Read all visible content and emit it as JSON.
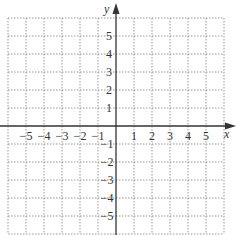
{
  "chart_data": {
    "type": "scatter",
    "title": "",
    "xlabel": "x",
    "ylabel": "y",
    "xlim": [
      -6,
      6
    ],
    "ylim": [
      -6,
      6
    ],
    "grid": true,
    "grid_style": "dotted",
    "x_ticks": [
      "-5",
      "-4",
      "-3",
      "-2",
      "-1",
      "1",
      "2",
      "3",
      "4",
      "5"
    ],
    "y_ticks": [
      "5",
      "4",
      "3",
      "2",
      "1",
      "-1",
      "-2",
      "-3",
      "-4",
      "-5"
    ],
    "series": []
  },
  "labels": {
    "x_axis": "x",
    "y_axis": "y",
    "x_neg": [
      "−5",
      "−4",
      "−3",
      "−2",
      "−1"
    ],
    "x_pos": [
      "1",
      "2",
      "3",
      "4",
      "5"
    ],
    "y_pos": [
      "5",
      "4",
      "3",
      "2",
      "1"
    ],
    "y_neg": [
      "−1",
      "−2",
      "−3",
      "−4",
      "−5"
    ]
  },
  "colors": {
    "grid": "#888888",
    "axis": "#333333"
  }
}
